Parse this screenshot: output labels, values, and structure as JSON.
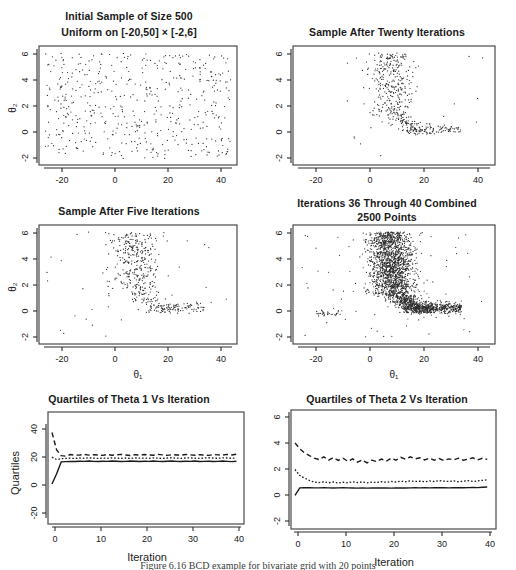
{
  "figure": {
    "caption": "Figure 6.16  BCD example for bivariate grid with 20 points",
    "panels": [
      {
        "id": "initial-sample",
        "title_lines": [
          "Initial Sample of Size 500",
          "Uniform on [-20,50]  ×  [-2,6]"
        ],
        "xlabel": "",
        "ylabel": "θ₂",
        "xticks": [
          "-20",
          "0",
          "20",
          "40"
        ],
        "yticks": [
          "6",
          "4",
          "2",
          "0",
          "-2"
        ]
      },
      {
        "id": "after-twenty",
        "title_lines": [
          "Sample After Twenty Iterations"
        ],
        "xlabel": "",
        "ylabel": "",
        "xticks": [
          "-20",
          "0",
          "20",
          "40"
        ],
        "yticks": [
          "6",
          "4",
          "2",
          "0",
          "-2"
        ]
      },
      {
        "id": "after-five",
        "title_lines": [
          "Sample After Five Iterations"
        ],
        "xlabel": "θ₁",
        "ylabel": "θ₂",
        "xticks": [
          "-20",
          "0",
          "20",
          "40"
        ],
        "yticks": [
          "6",
          "4",
          "2",
          "0",
          "-2"
        ]
      },
      {
        "id": "iterations-36-40",
        "title_lines": [
          "Iterations 36 Through 40 Combined",
          "2500 Points"
        ],
        "xlabel": "θ₁",
        "ylabel": "",
        "xticks": [
          "-20",
          "0",
          "20",
          "40"
        ],
        "yticks": [
          "6",
          "4",
          "2",
          "0",
          "-2"
        ]
      },
      {
        "id": "quartiles-theta1",
        "title_lines": [
          "Quartiles of Theta 1 Vs Iteration"
        ],
        "xlabel": "Iteration",
        "ylabel": "Quartiles",
        "xticks": [
          "0",
          "10",
          "20",
          "30",
          "40"
        ],
        "yticks": [
          "40",
          "20",
          "0",
          "-20"
        ]
      },
      {
        "id": "quartiles-theta2",
        "title_lines": [
          "Quartiles of Theta 2 Vs Iteration"
        ],
        "xlabel": "Iteration",
        "ylabel": "",
        "xticks": [
          "0",
          "10",
          "20",
          "30",
          "40"
        ],
        "yticks": [
          "6",
          "4",
          "2",
          "0",
          "-2"
        ]
      }
    ]
  },
  "chart_data": [
    {
      "type": "scatter",
      "id": "initial-sample",
      "title": "Initial Sample of Size 500 / Uniform on [-20,50] × [-2,6]",
      "xlabel": "",
      "ylabel": "θ₂",
      "xlim": [
        -22,
        52
      ],
      "ylim": [
        -2.4,
        6.4
      ],
      "n_points": 500,
      "distribution": "uniform",
      "grid": false,
      "legend": "none",
      "note": "500 points uniform over [-20,50] x [-2,6]"
    },
    {
      "type": "scatter",
      "id": "after-twenty",
      "title": "Sample After Twenty Iterations",
      "xlabel": "",
      "ylabel": "",
      "xlim": [
        -22,
        52
      ],
      "ylim": [
        -2.4,
        6.4
      ],
      "n_points": 500,
      "distribution": "banana-posterior",
      "grid": false,
      "legend": "none",
      "note": "L-shaped / banana-shaped concentration near theta1 ~ 12-25, theta2 ~ 0-6"
    },
    {
      "type": "scatter",
      "id": "after-five",
      "title": "Sample After Five Iterations",
      "xlabel": "θ₁",
      "ylabel": "θ₂",
      "xlim": [
        -22,
        52
      ],
      "ylim": [
        -2.4,
        6.4
      ],
      "n_points": 500,
      "distribution": "banana-posterior",
      "grid": false,
      "legend": "none",
      "note": "partially converged, more scatter outliers than iteration 20"
    },
    {
      "type": "scatter",
      "id": "iterations-36-40",
      "title": "Iterations 36 Through 40 Combined / 2500 Points",
      "xlabel": "θ₁",
      "ylabel": "",
      "xlim": [
        -22,
        52
      ],
      "ylim": [
        -2.4,
        6.4
      ],
      "n_points": 2500,
      "distribution": "banana-posterior",
      "grid": false,
      "legend": "none",
      "note": "dense L / banana shape, tail extending right along theta2 ~ 0.2"
    },
    {
      "type": "line",
      "id": "quartiles-theta1",
      "title": "Quartiles of Theta 1 Vs Iteration",
      "xlabel": "Iteration",
      "ylabel": "Quartiles",
      "xlim": [
        0,
        41
      ],
      "ylim": [
        -28,
        48
      ],
      "xticks": [
        0,
        10,
        20,
        30,
        40
      ],
      "yticks": [
        -20,
        0,
        20,
        40
      ],
      "grid": false,
      "legend": "none",
      "x": [
        0,
        1,
        2,
        3,
        4,
        5,
        6,
        7,
        8,
        9,
        10,
        11,
        12,
        13,
        14,
        15,
        16,
        17,
        18,
        19,
        20,
        21,
        22,
        23,
        24,
        25,
        26,
        27,
        28,
        29,
        30,
        31,
        32,
        33,
        34,
        35,
        36,
        37,
        38,
        39,
        40
      ],
      "series": [
        {
          "name": "upper quartile",
          "style": "dashed",
          "values": [
            34.5,
            22.5,
            18.5,
            18.2,
            19.3,
            18.8,
            19.0,
            19.4,
            18.9,
            19.2,
            19.0,
            18.7,
            19.3,
            18.8,
            19.1,
            19.4,
            19.0,
            18.6,
            19.2,
            18.9,
            19.3,
            19.0,
            18.8,
            19.4,
            19.1,
            18.7,
            19.2,
            19.0,
            18.9,
            19.3,
            19.1,
            18.8,
            19.2,
            19.0,
            18.7,
            19.3,
            19.1,
            18.9,
            19.4,
            19.0,
            19.5
          ]
        },
        {
          "name": "median",
          "style": "dotted",
          "values": [
            17.5,
            15.8,
            16.4,
            16.6,
            16.8,
            16.6,
            16.9,
            16.7,
            17.0,
            16.8,
            16.6,
            16.9,
            16.7,
            17.0,
            16.8,
            16.7,
            16.9,
            16.6,
            17.0,
            16.8,
            16.9,
            16.7,
            17.0,
            16.8,
            16.6,
            16.9,
            17.1,
            16.8,
            16.7,
            16.9,
            17.0,
            16.8,
            16.6,
            16.9,
            17.1,
            16.8,
            16.7,
            17.0,
            16.9,
            16.7,
            17.0
          ]
        },
        {
          "name": "lower quartile",
          "style": "solid",
          "values": [
            -1.0,
            6.0,
            14.2,
            14.4,
            14.6,
            14.5,
            14.7,
            14.6,
            14.8,
            14.6,
            14.5,
            14.7,
            14.6,
            14.8,
            14.7,
            14.5,
            14.6,
            14.8,
            14.7,
            14.5,
            14.7,
            14.6,
            14.8,
            14.6,
            14.5,
            14.7,
            14.8,
            14.6,
            14.5,
            14.7,
            14.6,
            14.8,
            14.5,
            14.6,
            14.7,
            14.5,
            14.6,
            14.8,
            14.6,
            14.4,
            14.7
          ]
        }
      ]
    },
    {
      "type": "line",
      "id": "quartiles-theta2",
      "title": "Quartiles of Theta 2 Vs Iteration",
      "xlabel": "Iteration",
      "ylabel": "",
      "xlim": [
        0,
        41
      ],
      "ylim": [
        -2.4,
        6.4
      ],
      "xticks": [
        0,
        10,
        20,
        30,
        40
      ],
      "yticks": [
        -2,
        0,
        2,
        4,
        6
      ],
      "grid": false,
      "legend": "none",
      "x": [
        0,
        1,
        2,
        3,
        4,
        5,
        6,
        7,
        8,
        9,
        10,
        11,
        12,
        13,
        14,
        15,
        16,
        17,
        18,
        19,
        20,
        21,
        22,
        23,
        24,
        25,
        26,
        27,
        28,
        29,
        30,
        31,
        32,
        33,
        34,
        35,
        36,
        37,
        38,
        39,
        40
      ],
      "series": [
        {
          "name": "upper quartile",
          "style": "dashed",
          "values": [
            4.0,
            3.55,
            3.25,
            3.05,
            2.85,
            2.75,
            2.95,
            2.7,
            2.9,
            2.68,
            2.85,
            2.62,
            2.8,
            2.55,
            2.72,
            2.5,
            2.7,
            2.6,
            2.78,
            2.62,
            2.85,
            2.7,
            2.92,
            2.78,
            2.95,
            2.8,
            2.88,
            2.72,
            2.85,
            2.7,
            2.82,
            2.68,
            2.8,
            2.72,
            2.85,
            2.7,
            2.78,
            2.88,
            2.72,
            2.84,
            2.76
          ]
        },
        {
          "name": "median",
          "style": "dotted",
          "values": [
            2.0,
            1.55,
            1.35,
            1.18,
            1.05,
            1.02,
            1.08,
            1.0,
            1.06,
            0.98,
            1.04,
            1.0,
            1.08,
            1.02,
            1.06,
            1.0,
            1.05,
            1.02,
            1.08,
            1.04,
            1.1,
            1.06,
            1.12,
            1.08,
            1.14,
            1.1,
            1.12,
            1.08,
            1.14,
            1.1,
            1.16,
            1.12,
            1.1,
            1.14,
            1.08,
            1.12,
            1.16,
            1.1,
            1.14,
            1.18,
            1.22
          ]
        },
        {
          "name": "lower quartile",
          "style": "solid",
          "values": [
            0.05,
            0.62,
            0.64,
            0.63,
            0.62,
            0.62,
            0.63,
            0.62,
            0.61,
            0.62,
            0.63,
            0.62,
            0.61,
            0.6,
            0.61,
            0.6,
            0.61,
            0.62,
            0.61,
            0.62,
            0.6,
            0.61,
            0.62,
            0.61,
            0.62,
            0.63,
            0.62,
            0.63,
            0.62,
            0.63,
            0.64,
            0.63,
            0.62,
            0.63,
            0.64,
            0.63,
            0.64,
            0.65,
            0.64,
            0.66,
            0.68
          ]
        }
      ]
    }
  ]
}
